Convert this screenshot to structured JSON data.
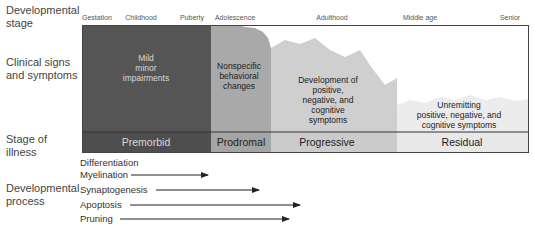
{
  "row_labels": {
    "developmental_stage": [
      "Developmental",
      "stage"
    ],
    "clinical_signs": [
      "Clinical signs",
      "and symptoms"
    ],
    "stage_of_illness": [
      "Stage of",
      "illness"
    ],
    "developmental_process": [
      "Developmental",
      "process"
    ]
  },
  "developmental_stages": [
    "Gestation",
    "Childhood",
    "Puberty",
    "Adolescence",
    "Adulthood",
    "Middle age",
    "Senior"
  ],
  "clinical_phases": [
    {
      "lines": [
        "Mild",
        "minor",
        "impairments"
      ],
      "color": "#555555",
      "text_color": "#d8d8d8"
    },
    {
      "lines": [
        "Nonspecific",
        "behavioral",
        "changes"
      ],
      "color": "#a9a9a9",
      "text_color": "#222222"
    },
    {
      "lines": [
        "Development of",
        "positive,",
        "negative, and",
        "cognitive",
        "symptoms"
      ],
      "color": "#cfcfcf",
      "text_color": "#222222"
    },
    {
      "lines": [
        "Unremitting",
        "positive, negative, and",
        "cognitive symptoms"
      ],
      "color": "#ececec",
      "text_color": "#222222"
    }
  ],
  "illness_stages": [
    "Premorbid",
    "Prodromal",
    "Progressive",
    "Residual"
  ],
  "processes": [
    {
      "label": "Differentiation",
      "arrow": false
    },
    {
      "label": "Myelination",
      "arrow": true
    },
    {
      "label": "Synaptogenesis",
      "arrow": true
    },
    {
      "label": "Apoptosis",
      "arrow": true
    },
    {
      "label": "Pruning",
      "arrow": true
    }
  ]
}
